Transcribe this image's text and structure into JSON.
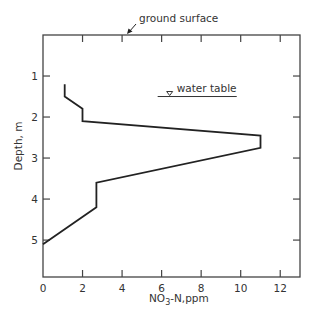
{
  "chart_data": {
    "type": "line",
    "title": "",
    "xlabel": "NO3-N,ppm",
    "xlabel_parts": {
      "pre": "NO",
      "sub": "3",
      "post": "-N,ppm"
    },
    "ylabel": "Depth, m",
    "xlim": [
      0,
      13
    ],
    "ylim": [
      0,
      5.9
    ],
    "y_inverted": true,
    "grid": false,
    "legend": null,
    "x_ticks": [
      0,
      2,
      4,
      6,
      8,
      10,
      12
    ],
    "y_ticks": [
      1,
      2,
      3,
      4,
      5
    ],
    "series": [
      {
        "name": "NO3-N profile",
        "points": [
          {
            "x": 1.1,
            "y": 1.2
          },
          {
            "x": 1.1,
            "y": 1.5
          },
          {
            "x": 2.0,
            "y": 1.8
          },
          {
            "x": 2.0,
            "y": 2.1
          },
          {
            "x": 11.0,
            "y": 2.45
          },
          {
            "x": 11.0,
            "y": 2.75
          },
          {
            "x": 2.7,
            "y": 3.6
          },
          {
            "x": 2.7,
            "y": 4.2
          },
          {
            "x": 0.0,
            "y": 5.1
          }
        ]
      }
    ],
    "annotations": [
      {
        "text": "ground surface",
        "type": "arrow-label",
        "points_to_depth": 0
      },
      {
        "text": "water table",
        "type": "water-table-line",
        "depth": 1.5,
        "x_range": [
          5.8,
          9.8
        ]
      }
    ]
  },
  "labels": {
    "ground_surface": "ground surface",
    "water_table": "water table",
    "ylabel": "Depth, m",
    "xlabel_pre": "NO",
    "xlabel_sub": "3",
    "xlabel_post": "-N,ppm"
  }
}
